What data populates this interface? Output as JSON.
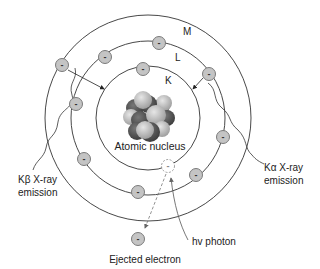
{
  "diagram": {
    "shells": [
      {
        "name": "K",
        "label": "K"
      },
      {
        "name": "L",
        "label": "L"
      },
      {
        "name": "M",
        "label": "M"
      }
    ],
    "nucleus_label": "Atomic nucleus",
    "left_annotation": {
      "line1": "Kβ X-ray",
      "line2": "emission"
    },
    "right_annotation": {
      "line1": "Kα X-ray",
      "line2": "emission"
    },
    "photon_label": "hv photon",
    "ejected_label": "Ejected electron",
    "electron_symbol": "-",
    "colors": {
      "electron_fill": "#c4c4c4",
      "electron_stroke": "#7a7a7a",
      "shell_stroke": "#333333",
      "nucleus_dark": "#555555",
      "nucleus_light": "#bdbdbd"
    }
  }
}
